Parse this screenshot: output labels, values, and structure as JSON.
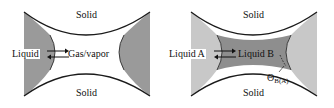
{
  "panels": [
    {
      "solid_top": "Solid",
      "solid_bottom": "Solid",
      "left_label": "Liquid",
      "center_label": "Gas/vapor",
      "side_fill": "#9a9a9a",
      "center_fill": "#ffffff"
    },
    {
      "solid_top": "Solid",
      "solid_bottom": "Solid",
      "left_label": "Liquid A",
      "center_label": "Liquid B",
      "angle_symbol": "Θ",
      "angle_subscript": "B(A)",
      "side_fill": "#c8c8c8",
      "center_fill": "#8e8e8e"
    }
  ],
  "colors": {
    "outline": "#1a1a1a",
    "background": "#ffffff"
  }
}
